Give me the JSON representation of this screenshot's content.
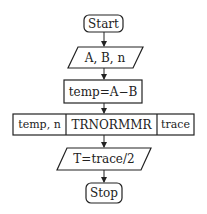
{
  "diagram": {
    "type": "flowchart",
    "nodes": [
      {
        "id": "start",
        "shape": "rounded-rect",
        "label": "Start"
      },
      {
        "id": "input",
        "shape": "parallelogram",
        "label": "A, B, n"
      },
      {
        "id": "temp",
        "shape": "rect",
        "label": "temp=A−B"
      },
      {
        "id": "call",
        "shape": "subroutine-row",
        "cells": [
          "temp, n",
          "TRNORMMR",
          "trace"
        ]
      },
      {
        "id": "output",
        "shape": "parallelogram",
        "label": "T=trace/2"
      },
      {
        "id": "stop",
        "shape": "rounded-rect",
        "label": "Stop"
      }
    ],
    "edges": [
      {
        "from": "start",
        "to": "input"
      },
      {
        "from": "input",
        "to": "temp"
      },
      {
        "from": "temp",
        "to": "call"
      },
      {
        "from": "call",
        "to": "output"
      },
      {
        "from": "output",
        "to": "stop"
      }
    ]
  }
}
